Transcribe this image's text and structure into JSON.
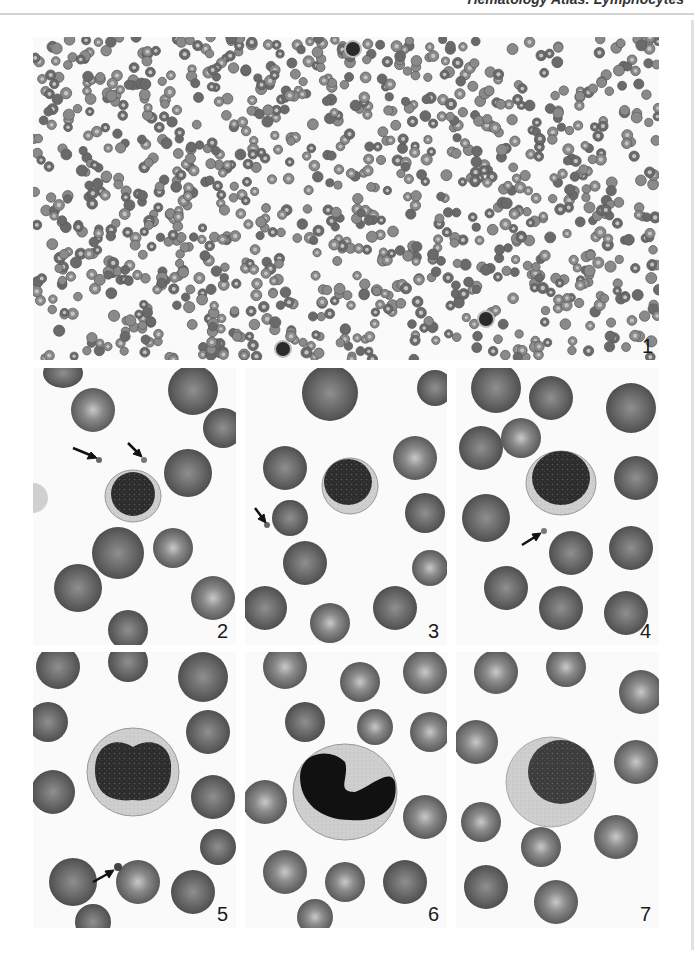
{
  "header": {
    "running_head": "Hematology Atlas: Lymphocytes"
  },
  "figure": {
    "panels": [
      {
        "number": "1",
        "description": "Low-power blood smear with many erythrocytes and scattered lymphocytes"
      },
      {
        "number": "2",
        "description": "Small lymphocyte with platelets (arrows)"
      },
      {
        "number": "3",
        "description": "Small lymphocyte with platelet (arrow)"
      },
      {
        "number": "4",
        "description": "Lymphocyte with platelet (arrow)"
      },
      {
        "number": "5",
        "description": "Large lymphocyte with indented nucleus and platelet (arrow)"
      },
      {
        "number": "6",
        "description": "Lymphocyte with cleaved dark nucleus"
      },
      {
        "number": "7",
        "description": "Large lymphocyte with pale cytoplasm"
      }
    ],
    "colors": {
      "background": "#ffffff",
      "erythrocyte": "#6e6e6e",
      "erythrocyte_center": "#b5b5b5",
      "nucleus": "#2a2a2a",
      "cytoplasm": "#c8c8c8",
      "arrow": "#111111"
    }
  }
}
